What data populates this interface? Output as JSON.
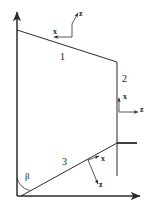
{
  "figure": {
    "type": "technical-line-diagram",
    "background_color": "#ffffff",
    "line_color": "#2b2b2b",
    "text_color": "#1a1a1a"
  },
  "axes": {
    "vertical": {
      "name": "vertical-axis",
      "arrow": "up"
    },
    "horizontal": {
      "name": "horizontal-axis",
      "arrow": "right"
    }
  },
  "edges": [
    {
      "id": "1",
      "label": "1",
      "name": "edge-1-top-slanted"
    },
    {
      "id": "2",
      "label": "2",
      "name": "edge-2-right-vertical"
    },
    {
      "id": "3",
      "label": "3",
      "name": "edge-3-lower-slanted"
    }
  ],
  "frames": [
    {
      "name": "frame-top",
      "x_label": "x",
      "z_label": "z",
      "x_direction": "left",
      "z_direction": "up-right"
    },
    {
      "name": "frame-right",
      "x_label": "x",
      "z_label": "z",
      "x_direction": "up",
      "z_direction": "right"
    },
    {
      "name": "frame-lower",
      "x_label": "x",
      "z_label": "z",
      "x_direction": "up-right",
      "z_direction": "down-right"
    }
  ],
  "angle": {
    "name": "angle-beta",
    "symbol": "β",
    "between": "vertical-axis and edge-3"
  }
}
